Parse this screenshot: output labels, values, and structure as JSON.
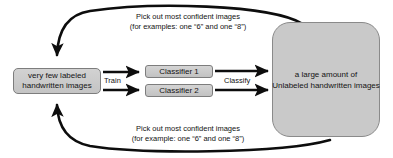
{
  "diagram": {
    "colors": {
      "box_fill": "#c9c9c9",
      "box_border": "#7d7d7d",
      "arrow": "#0d0d0d",
      "text": "#121212",
      "background": "#ffffff"
    },
    "nodes": {
      "labeled_images": {
        "line1": "very few labeled",
        "line2": "handwritten images"
      },
      "classifier_1": {
        "label": "Classifier 1"
      },
      "classifier_2": {
        "label": "Classifier 2"
      },
      "unlabeled_images": {
        "line1": "a large amount of",
        "line2": "Unlabeled handwritten images"
      }
    },
    "edges": {
      "train": {
        "label": "Train"
      },
      "classify": {
        "label": "Classify"
      },
      "feedback_top": {
        "line1": "Pick out most confident images",
        "line2": "(for examples: one “6” and one “8”)"
      },
      "feedback_bottom": {
        "line1": "Pick out most confident images",
        "line2": "(for example: one “6” and one “8”)"
      }
    }
  }
}
